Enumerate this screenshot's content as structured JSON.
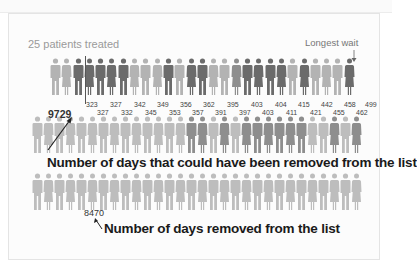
{
  "labels": {
    "patients_treated": "25 patients treated",
    "longest_wait": "Longest wait",
    "total_days_could_remove": "9729",
    "total_days_removed": "8470",
    "caption_could_remove": "Number of days that could have been removed from the list",
    "caption_removed": "Number of days removed from the list"
  },
  "colors": {
    "dark": "#6b6b6b",
    "mid": "#8e8e8e",
    "light": "#b3b3b3",
    "pale": "#bdbdbd"
  },
  "chart_data": {
    "type": "pictogram",
    "title": "",
    "annotations": [
      "25 patients treated",
      "Longest wait",
      "9729",
      "8470",
      "Number of days that could have been removed from the list",
      "Number of days removed from the list"
    ],
    "top_row_wait_days": [
      323,
      327,
      327,
      332,
      342,
      345,
      349,
      353,
      356,
      357,
      362,
      391,
      395,
      397,
      403,
      403,
      404,
      411,
      415,
      421,
      442,
      455,
      458,
      462,
      499
    ],
    "upper_labels": [
      323,
      327,
      342,
      349,
      356,
      362,
      395,
      403,
      404,
      415,
      442,
      458,
      499
    ],
    "lower_labels": [
      327,
      332,
      345,
      353,
      357,
      391,
      397,
      403,
      411,
      421,
      455,
      462
    ],
    "days_could_have_been_removed": 9729,
    "days_removed": 8470,
    "patients_treated": 25
  }
}
